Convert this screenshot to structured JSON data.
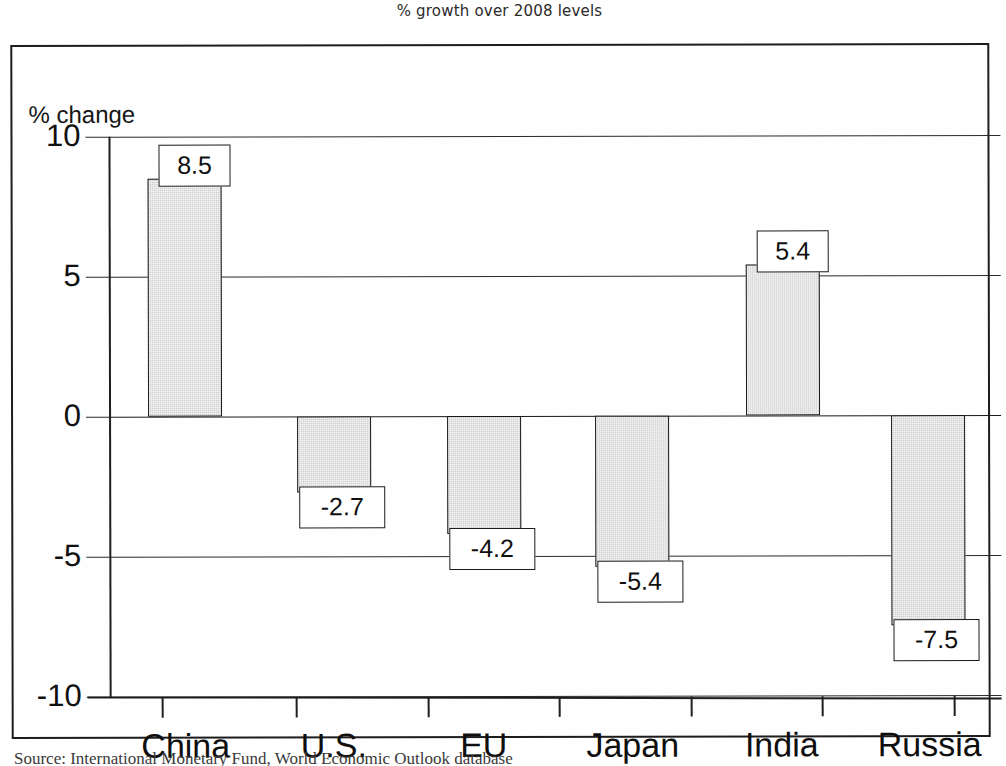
{
  "chart_data": {
    "type": "bar",
    "title": "% growth over 2008 levels",
    "xlabel": "",
    "ylabel": "% change",
    "ylim": [
      -10,
      10
    ],
    "yticks": [
      "10",
      "5",
      "0",
      "-5",
      "-10"
    ],
    "ytick_values": [
      10,
      5,
      0,
      -5,
      -10
    ],
    "grid": true,
    "legend": "none",
    "categories": [
      "China",
      "U.S.",
      "EU",
      "Japan",
      "India",
      "Russia"
    ],
    "values": [
      8.5,
      -2.7,
      -4.2,
      -5.4,
      5.4,
      -7.5
    ],
    "value_labels": [
      "8.5",
      "-2.7",
      "-4.2",
      "-5.4",
      "5.4",
      "-7.5"
    ],
    "bar_fill_color": "#cfcfcf",
    "bar_border_color": "#1b1b1b",
    "background_color": "#fefefe"
  },
  "source_note": "Source: International Monetary Fund, World Economic Outlook database"
}
